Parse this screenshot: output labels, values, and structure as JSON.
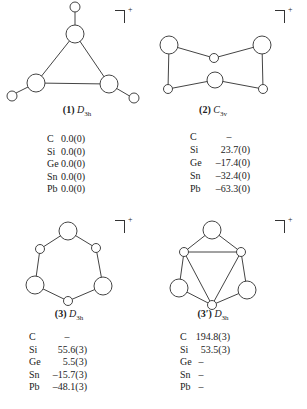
{
  "charge_label": "+",
  "structures": [
    {
      "id": "1",
      "label": "(1)",
      "symmetry_main": "D",
      "symmetry_sub": "3h",
      "geometry": "triangle with three terminal small atoms",
      "energies": [
        {
          "element": "C",
          "value": "0.0(0)"
        },
        {
          "element": "Si",
          "value": "0.0(0)"
        },
        {
          "element": "Ge",
          "value": "0.0(0)"
        },
        {
          "element": "Sn",
          "value": "0.0(0)"
        },
        {
          "element": "Pb",
          "value": "0.0(0)"
        }
      ]
    },
    {
      "id": "2",
      "label": "(2)",
      "symmetry_main": "C",
      "symmetry_sub": "3v",
      "geometry": "bicyclic open cage",
      "energies": [
        {
          "element": "C",
          "value": "–"
        },
        {
          "element": "Si",
          "value": "23.7(0)"
        },
        {
          "element": "Ge",
          "value": "–17.4(0)"
        },
        {
          "element": "Sn",
          "value": "–32.4(0)"
        },
        {
          "element": "Pb",
          "value": "–63.3(0)"
        }
      ]
    },
    {
      "id": "3",
      "label": "(3)",
      "symmetry_main": "D",
      "symmetry_sub": "3h",
      "geometry": "six-membered ring",
      "energies": [
        {
          "element": "C",
          "value": "–"
        },
        {
          "element": "Si",
          "value": "55.6(3)"
        },
        {
          "element": "Ge",
          "value": "5.5(3)"
        },
        {
          "element": "Sn",
          "value": "–15.7(3)"
        },
        {
          "element": "Pb",
          "value": "–48.1(3)"
        }
      ]
    },
    {
      "id": "3prime",
      "label": "(3′)",
      "symmetry_main": "D",
      "symmetry_sub": "3h",
      "geometry": "inner triangle with capping atoms",
      "energies": [
        {
          "element": "C",
          "value": "194.8(3)"
        },
        {
          "element": "Si",
          "value": "53.5(3)"
        },
        {
          "element": "Ge",
          "value": "–"
        },
        {
          "element": "Sn",
          "value": "–"
        },
        {
          "element": "Pb",
          "value": "–"
        }
      ]
    }
  ]
}
